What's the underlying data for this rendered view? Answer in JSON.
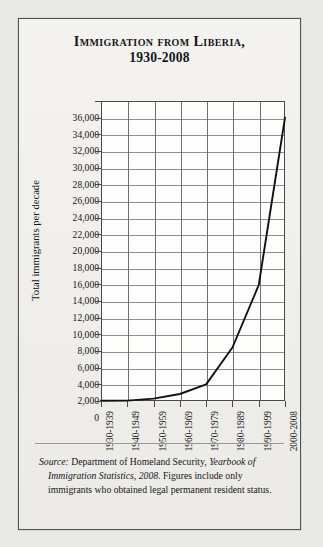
{
  "figure": {
    "title_line1": "Immigration from Liberia,",
    "title_line2": "1930-2008",
    "source_prefix": "Source:",
    "source_text_1": " Department of Homeland Security, ",
    "source_italic": "Yearbook of Immigration Statistics, 2008",
    "source_text_2": ". Figures include only immigrants who obtained legal permanent resident status."
  },
  "chart_data": {
    "type": "line",
    "title": "Immigration from Liberia, 1930-2008",
    "xlabel": "",
    "ylabel": "Total immigrants per decade",
    "categories": [
      "1930-1939",
      "1940-1949",
      "1950-1959",
      "1960-1969",
      "1970-1979",
      "1980-1989",
      "1990-1999",
      "2000-2008"
    ],
    "values": [
      35,
      50,
      290,
      840,
      2000,
      6420,
      13900,
      34000
    ],
    "ylim": [
      0,
      36000
    ],
    "ytick_step": 2000,
    "yticks": [
      "0",
      "2,000",
      "4,000",
      "6,000",
      "8,000",
      "10,000",
      "12,000",
      "14,000",
      "16,000",
      "18,000",
      "20,000",
      "22,000",
      "24,000",
      "26,000",
      "28,000",
      "30,000",
      "32,000",
      "34,000",
      "36,000"
    ],
    "grid": true,
    "legend": false,
    "line_color": "#111111"
  }
}
